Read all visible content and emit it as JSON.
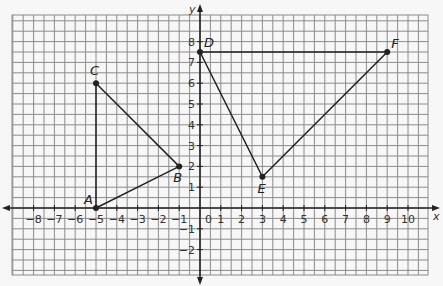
{
  "chart_data": {
    "type": "scatter",
    "title": "",
    "xlabel": "x",
    "ylabel": "y",
    "xlim": [
      -9,
      11
    ],
    "ylim": [
      -3,
      9
    ],
    "grid": true,
    "grid_minor_step": 0.5,
    "x_ticks": [
      -8,
      -7,
      -6,
      -5,
      -4,
      -3,
      -2,
      -1,
      0,
      1,
      2,
      3,
      4,
      5,
      6,
      7,
      8,
      9,
      10
    ],
    "y_ticks": [
      -2,
      -1,
      1,
      2,
      3,
      4,
      5,
      6,
      7,
      8
    ],
    "origin_label": "0",
    "points": [
      {
        "label": "A",
        "x": -5,
        "y": 0
      },
      {
        "label": "B",
        "x": -1,
        "y": 2
      },
      {
        "label": "C",
        "x": -5,
        "y": 6
      },
      {
        "label": "D",
        "x": 0,
        "y": 7.5
      },
      {
        "label": "E",
        "x": 3,
        "y": 1.5
      },
      {
        "label": "F",
        "x": 9,
        "y": 7.5
      }
    ],
    "triangles": [
      {
        "name": "ABC",
        "vertices": [
          "A",
          "B",
          "C"
        ]
      },
      {
        "name": "DEF",
        "vertices": [
          "D",
          "E",
          "F"
        ]
      }
    ]
  },
  "colors": {
    "background": "#f7f7f7",
    "grid": "#8a8a8a",
    "axis": "#222222",
    "shape": "#222222"
  }
}
